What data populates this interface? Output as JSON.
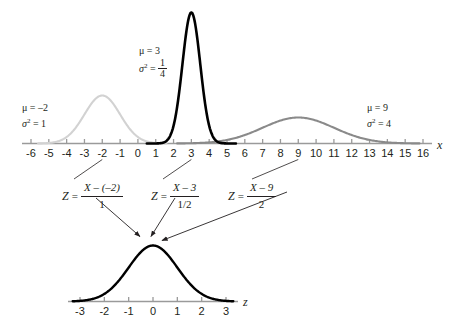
{
  "chart_data": {
    "type": "line",
    "top_panel": {
      "xlabel": "x",
      "axis_range": [
        -6.6,
        16.6
      ],
      "ticks": [
        -6,
        -5,
        -4,
        -3,
        -2,
        -1,
        0,
        1,
        2,
        3,
        4,
        5,
        6,
        7,
        8,
        9,
        10,
        11,
        12,
        13,
        14,
        15,
        16
      ],
      "tick_labels": [
        "-6",
        "-5",
        "-4",
        "-3",
        "-2",
        "-1",
        "0",
        "1",
        "2",
        "3",
        "4",
        "5",
        "6",
        "7",
        "8",
        "9",
        "10",
        "11",
        "12",
        "13",
        "14",
        "15",
        "16"
      ],
      "grid": false,
      "legend": "none",
      "series": [
        {
          "name": "normal-mu-neg2",
          "mean": -2,
          "variance": 1,
          "sigma": 1,
          "color": "#d2d2d2",
          "peak_height_px": 48,
          "label": {
            "mu": "μ = –2",
            "sigma2_lhs": "σ",
            "sigma2_exp": "2",
            "sigma2_rhs": "= 1"
          }
        },
        {
          "name": "normal-mu-3",
          "mean": 3,
          "variance": 0.25,
          "sigma": 0.5,
          "color": "#000000",
          "peak_height_px": 131,
          "label": {
            "mu": "μ = 3",
            "sigma2_lhs": "σ",
            "sigma2_exp": "2",
            "sigma2_rhs": "=",
            "sigma2_num": "1",
            "sigma2_den": "4"
          }
        },
        {
          "name": "normal-mu-9",
          "mean": 9,
          "variance": 4,
          "sigma": 2,
          "color": "#8a8a8a",
          "peak_height_px": 26,
          "label": {
            "mu": "μ = 9",
            "sigma2_lhs": "σ",
            "sigma2_exp": "2",
            "sigma2_rhs": "= 4"
          }
        }
      ]
    },
    "bottom_panel": {
      "xlabel": "z",
      "axis_range": [
        -3.6,
        3.6
      ],
      "ticks": [
        -3,
        -2,
        -1,
        0,
        1,
        2,
        3
      ],
      "tick_labels": [
        "-3",
        "-2",
        "-1",
        "0",
        "1",
        "2",
        "3"
      ],
      "grid": false,
      "legend": "none",
      "series": [
        {
          "name": "standard-normal",
          "mean": 0,
          "variance": 1,
          "sigma": 1,
          "color": "#000000",
          "peak_height_px": 56
        }
      ]
    },
    "transformations": [
      {
        "name": "z-formula-mu-neg2",
        "z": "Z",
        "equals": "=",
        "numerator": "X – (–2)",
        "denominator": "1",
        "source_mean": -2
      },
      {
        "name": "z-formula-mu-3",
        "z": "Z",
        "equals": "=",
        "numerator": "X – 3",
        "denominator": "1/2",
        "source_mean": 3
      },
      {
        "name": "z-formula-mu-9",
        "z": "Z",
        "equals": "=",
        "numerator": "X – 9",
        "denominator": "2",
        "source_mean": 9
      }
    ]
  },
  "colors": {
    "curve_light": "#d2d2d2",
    "curve_dark": "#000000",
    "curve_medium": "#8a8a8a",
    "axis": "#9a9a9a",
    "text": "#231f20"
  }
}
